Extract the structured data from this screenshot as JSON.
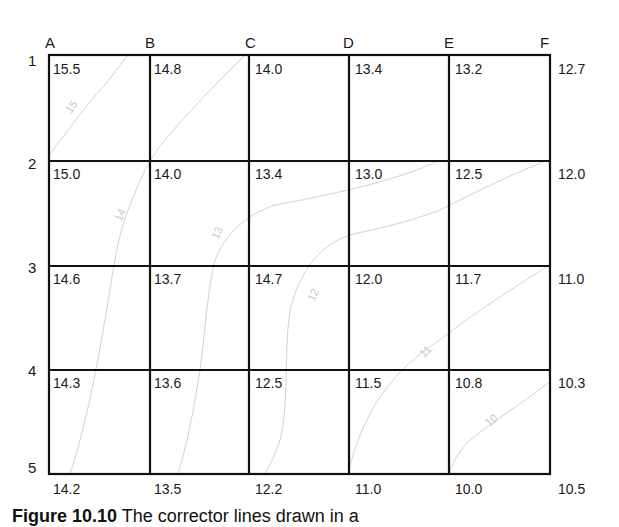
{
  "diagram": {
    "type": "grid_with_contours",
    "columns": [
      "A",
      "B",
      "C",
      "D",
      "E",
      "F"
    ],
    "rows": [
      "1",
      "2",
      "3",
      "4",
      "5"
    ],
    "grid_values": [
      [
        "15.5",
        "14.8",
        "14.0",
        "13.4",
        "13.2",
        "12.7"
      ],
      [
        "15.0",
        "14.0",
        "13.4",
        "13.0",
        "12.5",
        "12.0"
      ],
      [
        "14.6",
        "13.7",
        "14.7",
        "12.0",
        "11.7",
        "11.0"
      ],
      [
        "14.3",
        "13.6",
        "12.5",
        "11.5",
        "10.8",
        "10.3"
      ],
      [
        "14.2",
        "13.5",
        "12.2",
        "11.0",
        "10.0",
        "10.5"
      ]
    ],
    "contours": [
      {
        "label": "15"
      },
      {
        "label": "14"
      },
      {
        "label": "13"
      },
      {
        "label": "12"
      },
      {
        "label": "11"
      },
      {
        "label": "10"
      }
    ],
    "caption": {
      "prefix": "Figure 10.10",
      "text": "  The corrector lines drawn in a"
    }
  }
}
